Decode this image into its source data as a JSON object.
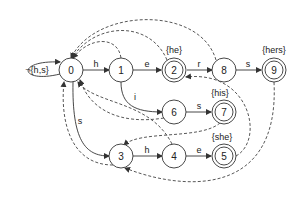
{
  "diagram": {
    "type": "aho-corasick-automaton",
    "start_loop_label": "¬{h,s}",
    "nodes": [
      {
        "id": "0",
        "label": "0",
        "accepting": false
      },
      {
        "id": "1",
        "label": "1",
        "accepting": false
      },
      {
        "id": "2",
        "label": "2",
        "accepting": true,
        "output": "{he}"
      },
      {
        "id": "8",
        "label": "8",
        "accepting": false
      },
      {
        "id": "9",
        "label": "9",
        "accepting": true,
        "output": "{hers}"
      },
      {
        "id": "6",
        "label": "6",
        "accepting": false
      },
      {
        "id": "7",
        "label": "7",
        "accepting": true,
        "output": "{his}"
      },
      {
        "id": "3",
        "label": "3",
        "accepting": false
      },
      {
        "id": "4",
        "label": "4",
        "accepting": false
      },
      {
        "id": "5",
        "label": "5",
        "accepting": true,
        "output": "{she}"
      }
    ],
    "goto_edges": [
      {
        "from": "0",
        "to": "0",
        "label": "¬{h,s}"
      },
      {
        "from": "0",
        "to": "1",
        "label": "h"
      },
      {
        "from": "1",
        "to": "2",
        "label": "e"
      },
      {
        "from": "2",
        "to": "8",
        "label": "r"
      },
      {
        "from": "8",
        "to": "9",
        "label": "s"
      },
      {
        "from": "1",
        "to": "6",
        "label": "i"
      },
      {
        "from": "6",
        "to": "7",
        "label": "s"
      },
      {
        "from": "0",
        "to": "3",
        "label": "s"
      },
      {
        "from": "3",
        "to": "4",
        "label": "h"
      },
      {
        "from": "4",
        "to": "5",
        "label": "e"
      }
    ],
    "failure_edges": [
      {
        "from": "1",
        "to": "0"
      },
      {
        "from": "2",
        "to": "0"
      },
      {
        "from": "8",
        "to": "0"
      },
      {
        "from": "9",
        "to": "3"
      },
      {
        "from": "6",
        "to": "0"
      },
      {
        "from": "7",
        "to": "3"
      },
      {
        "from": "3",
        "to": "0"
      },
      {
        "from": "4",
        "to": "0"
      },
      {
        "from": "5",
        "to": "2"
      }
    ]
  }
}
